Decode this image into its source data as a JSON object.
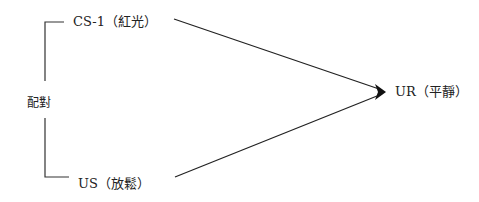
{
  "diagram": {
    "type": "classical-conditioning",
    "nodes": {
      "cs": {
        "label": "CS-1（紅光）"
      },
      "us": {
        "label": "US（放鬆）"
      },
      "ur": {
        "label": "UR（平靜）"
      },
      "pairing": {
        "label": "配對"
      }
    },
    "edges": [
      {
        "from": "cs",
        "to": "ur",
        "arrow": true
      },
      {
        "from": "us",
        "to": "ur",
        "arrow": true
      }
    ],
    "bracket": {
      "groups": [
        "cs",
        "us"
      ],
      "label": "配對"
    },
    "colors": {
      "line": "#222222",
      "background": "#ffffff"
    }
  }
}
